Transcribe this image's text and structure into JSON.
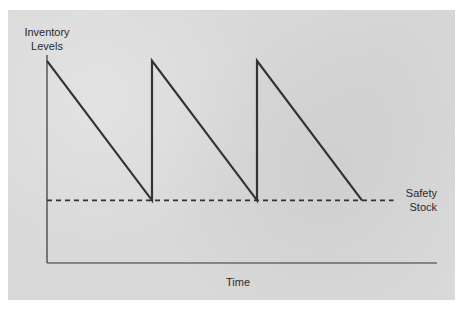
{
  "chart_data": {
    "type": "line",
    "title": "",
    "xlabel": "Time",
    "ylabel": "Inventory Levels",
    "ylabel_lines": [
      "Inventory",
      "Levels"
    ],
    "xlim": [
      0,
      3.6
    ],
    "ylim": [
      0,
      1.6
    ],
    "grid": false,
    "legend": "none",
    "series": [
      {
        "name": "Inventory level",
        "style": "solid",
        "x": [
          0,
          1,
          1,
          2,
          2,
          3
        ],
        "y": [
          1.45,
          0.45,
          1.45,
          0.45,
          1.45,
          0.45
        ]
      },
      {
        "name": "Safety Stock",
        "style": "dashed",
        "x": [
          0,
          3.3
        ],
        "y": [
          0.45,
          0.45
        ]
      }
    ],
    "annotations": [
      {
        "text_lines": [
          "Safety",
          "Stock"
        ],
        "anchor": "right-end-of-safety-stock-line"
      }
    ]
  },
  "colors": {
    "background": "#d9d9d9",
    "line": "#333333"
  }
}
